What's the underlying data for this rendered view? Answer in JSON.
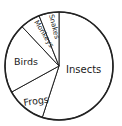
{
  "chart_data": {
    "type": "pie",
    "title": "",
    "categories": [
      "Insects",
      "Frogs",
      "Birds",
      "Monkeys",
      "Snakes"
    ],
    "values": [
      55,
      12,
      21,
      6,
      6
    ],
    "unit": "percent (estimated)",
    "start_angle_deg": 0,
    "direction": "clockwise",
    "labels_inside": true,
    "legend": "none"
  },
  "style": {
    "stroke": "#222222",
    "fill": "#ffffff"
  },
  "labels": {
    "insects": "Insects",
    "frogs": "Frogs",
    "birds": "Birds",
    "monkeys": "Monkeys",
    "snakes": "Snakes"
  }
}
